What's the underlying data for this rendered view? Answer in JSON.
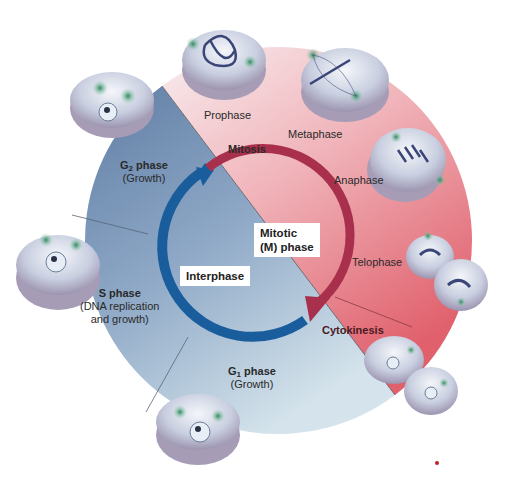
{
  "diagram": {
    "center_labels": {
      "interphase": "Interphase",
      "mitotic_line1": "Mitotic",
      "mitotic_line2": "(M) phase"
    },
    "interphase_sections": [
      {
        "id": "g2",
        "name_main": "G",
        "name_sub": "2",
        "name_rest": " phase",
        "desc": "(Growth)"
      },
      {
        "id": "s",
        "name": "S phase",
        "desc_line1": "(DNA replication",
        "desc_line2": "and growth)"
      },
      {
        "id": "g1",
        "name_main": "G",
        "name_sub": "1",
        "name_rest": " phase",
        "desc": "(Growth)"
      }
    ],
    "mitotic_labels": {
      "mitosis": "Mitosis",
      "cytokinesis": "Cytokinesis",
      "stages": [
        "Prophase",
        "Metaphase",
        "Anaphase",
        "Telophase"
      ]
    },
    "colors": {
      "interphase_dark": "#6b87ab",
      "interphase_light": "#c9dbe6",
      "mitotic_light": "#f6e3e6",
      "mitotic_dark": "#e0606c",
      "interphase_arrow": "#1a5d9c",
      "mitosis_arrow": "#a8304c"
    }
  }
}
